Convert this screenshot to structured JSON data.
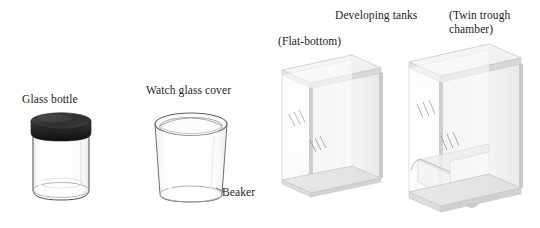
{
  "figure": {
    "background_color": "#ffffff",
    "width": 540,
    "height": 228
  },
  "labels": {
    "glass_bottle": "Glass bottle",
    "watch_glass_cover": "Watch glass cover",
    "beaker": "Beaker",
    "developing_tanks": "Developing tanks",
    "flat_bottom": "(Flat-bottom)",
    "twin_trough_chamber": "(Twin trough chamber)"
  },
  "objects": [
    {
      "name": "glass-bottle",
      "label": "Glass bottle",
      "parts": [
        "black screw cap",
        "clear cylindrical glass jar"
      ],
      "cap_color": "#2b2b2b",
      "glass_color": "#fafafa",
      "outline_color": "#555555"
    },
    {
      "name": "beaker",
      "label": "Beaker",
      "parts": [
        "watch glass cover",
        "flared rim",
        "tapered clear body"
      ],
      "glass_color": "#fcfcfc",
      "outline_color": "#6a6a6a"
    },
    {
      "name": "flat-bottom-developing-tank",
      "label": "(Flat-bottom)",
      "parts": [
        "lid plate",
        "front glass wall",
        "side glass wall",
        "flat base"
      ],
      "glass_color": "#f2f3f3",
      "edge_color": "#c9cbcb"
    },
    {
      "name": "twin-trough-chamber",
      "label": "(Twin trough chamber)",
      "parts": [
        "lid plate",
        "front glass wall",
        "side glass wall",
        "central ridge",
        "twin troughs"
      ],
      "glass_color": "#f2f3f3",
      "edge_color": "#c9cbcb"
    }
  ]
}
